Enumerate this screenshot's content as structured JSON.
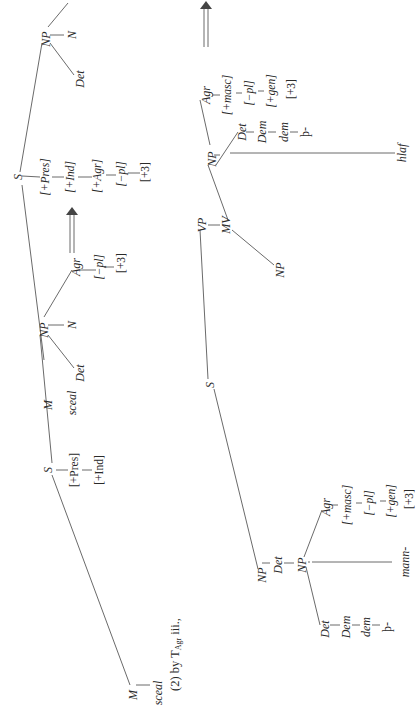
{
  "figure": {
    "caption_prefix": "(2) by T",
    "caption_sub": "Agr",
    "caption_suffix": " iii.,",
    "line_color": "#444444",
    "tree1": {
      "root": "S",
      "left": {
        "label": "M",
        "child": "sceal"
      },
      "features": [
        "[+Pres]",
        "[+Ind]"
      ],
      "np": {
        "label": "NP",
        "det": "Det",
        "n": "N",
        "agr": "Agr",
        "agr_features": [
          "[−pl]",
          "[+3]"
        ]
      }
    },
    "arrow1": "⟹",
    "tree2": {
      "root": "S",
      "left": {
        "label": "M",
        "child": "sceal"
      },
      "features": [
        "[+Pres]",
        "[+Ind]",
        "[+Agr]",
        "[−pl]",
        "[+3]"
      ],
      "np": {
        "label": "NP",
        "det": "Det",
        "n": "N",
        "agr": "Agr",
        "agr_features": [
          "[−pl]",
          "[+3]"
        ]
      }
    },
    "tree3": {
      "root": "S",
      "subject": {
        "np": "NP",
        "det": "Det",
        "inner_np": "NP",
        "inner_det": "Det",
        "dem": "Dem",
        "dem_lower": "dem",
        "thorn": "þ-",
        "n": "N",
        "noun": "mann-",
        "agr": "Agr",
        "agr_features": [
          "[+masc]",
          "[−pl]",
          "[+gen]",
          "[+3]"
        ]
      },
      "vp": {
        "label": "VP",
        "mv": "MV",
        "np_obj": "NP",
        "np": "NP",
        "det": "Det",
        "dem": "Dem",
        "dem_lower": "dem",
        "thorn": "þ-",
        "n": "N",
        "noun": "hlaf",
        "agr": "Agr",
        "agr_features": [
          "[+masc]",
          "[−pl]",
          "[+gen]",
          "[+3]"
        ]
      }
    },
    "arrow2": "⟹"
  }
}
